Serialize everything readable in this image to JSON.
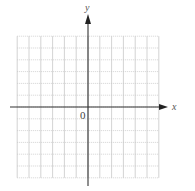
{
  "diagram": {
    "type": "coordinate-plane",
    "axes": {
      "x_label": "x",
      "y_label": "y",
      "origin_label": "0"
    },
    "grid": {
      "x_min": -6,
      "x_max": 6,
      "y_min": -6,
      "y_max": 6,
      "step": 1,
      "vertical_line_style": "solid",
      "horizontal_line_style": "dotted"
    },
    "colors": {
      "grid": "#c8c8c8",
      "axis": "#333333",
      "background": "#ffffff"
    }
  }
}
